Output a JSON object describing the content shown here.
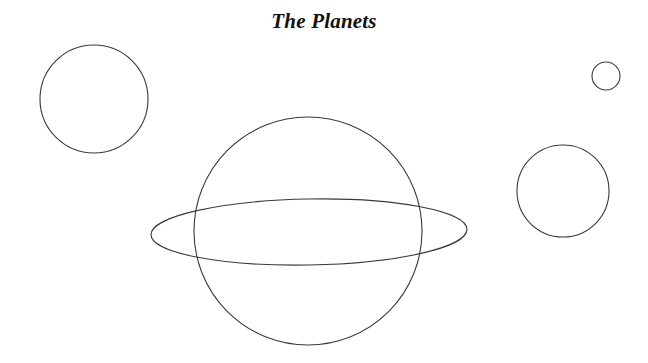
{
  "figure": {
    "title": "The Planets",
    "background_color": "#ffffff",
    "stroke_color": "#3a3a3a",
    "stroke_width": 1.1,
    "width": 648,
    "height": 363
  },
  "chart_data": {
    "type": "diagram",
    "title": "The Planets",
    "xlabel": "",
    "ylabel": "",
    "grid": false,
    "legend": false,
    "xlim": [
      0,
      648
    ],
    "ylim": [
      0,
      363
    ],
    "units": "pixels",
    "shape_count": 5,
    "shapes": [
      {
        "name": "planet-top-left",
        "shape": "circle",
        "cx": 94,
        "cy": 99,
        "r": 54,
        "fill": "none",
        "stroke": "#3a3a3a"
      },
      {
        "name": "planet-ringed-body",
        "shape": "circle",
        "cx": 308,
        "cy": 231,
        "r": 114,
        "fill": "none",
        "stroke": "#3a3a3a"
      },
      {
        "name": "planet-ring",
        "shape": "ellipse",
        "cx": 309,
        "cy": 232,
        "rx": 158,
        "ry": 33,
        "rotation_deg": -1,
        "fill": "none",
        "stroke": "#3a3a3a"
      },
      {
        "name": "planet-small-top-right",
        "shape": "circle",
        "cx": 606,
        "cy": 76,
        "r": 14,
        "fill": "none",
        "stroke": "#3a3a3a"
      },
      {
        "name": "planet-right",
        "shape": "circle",
        "cx": 563,
        "cy": 191,
        "r": 46,
        "fill": "none",
        "stroke": "#3a3a3a"
      }
    ]
  }
}
